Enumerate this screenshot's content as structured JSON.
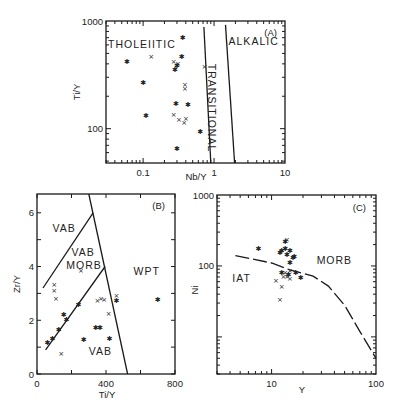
{
  "chart_data": [
    {
      "id": "A",
      "type": "scatter",
      "panel_label": "(A)",
      "xlabel": "Nb/Y",
      "ylabel": "Ti/Y",
      "xscale": "log",
      "yscale": "log",
      "xlim": [
        0.03,
        10
      ],
      "ylim": [
        48,
        1000
      ],
      "xticks": [
        {
          "v": 0.1,
          "label": "0.1"
        },
        {
          "v": 1,
          "label": "1"
        },
        {
          "v": 10,
          "label": "10"
        }
      ],
      "yticks": [
        {
          "v": 100,
          "label": "100"
        },
        {
          "v": 1000,
          "label": "1000"
        }
      ],
      "fields": [
        {
          "name": "THOLEIITIC",
          "x": 0.032,
          "y": 560,
          "rotate": 0
        },
        {
          "name": "TRANSITIONAL",
          "x": 0.83,
          "y": 400,
          "rotate": 90
        },
        {
          "name": "ALKALIC",
          "x": 1.6,
          "y": 600,
          "rotate": 0
        }
      ],
      "boundaries": [
        {
          "points": [
            [
              0.72,
              880
            ],
            [
              0.9,
              48
            ]
          ]
        },
        {
          "points": [
            [
              1.45,
              920
            ],
            [
              1.95,
              48
            ]
          ]
        }
      ],
      "series": [
        {
          "name": "asterisk",
          "marker": "✱",
          "points": [
            [
              0.059,
              417
            ],
            [
              0.28,
              350
            ],
            [
              0.35,
              463
            ],
            [
              0.36,
              700
            ],
            [
              0.1,
              266
            ],
            [
              0.29,
              170
            ],
            [
              0.43,
              165
            ],
            [
              0.11,
              132
            ],
            [
              0.64,
              94
            ],
            [
              0.3,
              65
            ],
            [
              0.3,
              380
            ]
          ]
        },
        {
          "name": "cross",
          "marker": "×",
          "points": [
            [
              0.13,
              463
            ],
            [
              0.27,
              417
            ],
            [
              0.31,
              395
            ],
            [
              0.39,
              255
            ],
            [
              0.39,
              235
            ],
            [
              0.27,
              135
            ],
            [
              0.32,
              120
            ],
            [
              0.4,
              122
            ],
            [
              0.38,
              113
            ],
            [
              0.73,
              375
            ]
          ]
        }
      ]
    },
    {
      "id": "B",
      "type": "scatter",
      "panel_label": "(B)",
      "xlabel": "Ti/Y",
      "ylabel": "Zr/Y",
      "xscale": "linear",
      "yscale": "linear",
      "xlim": [
        0,
        800
      ],
      "ylim": [
        0,
        6.7
      ],
      "xticks": [
        {
          "v": 0,
          "label": "0"
        },
        {
          "v": 400,
          "label": "400"
        },
        {
          "v": 800,
          "label": "800"
        }
      ],
      "yticks": [
        {
          "v": 0,
          "label": "0"
        },
        {
          "v": 2,
          "label": "2"
        },
        {
          "v": 4,
          "label": "4"
        },
        {
          "v": 6,
          "label": "6"
        }
      ],
      "fields": [
        {
          "name": "VAB",
          "x": 90,
          "y": 5.3
        },
        {
          "name": "VAB",
          "x": 200,
          "y": 4.4
        },
        {
          "name": "MORB",
          "x": 170,
          "y": 3.9
        },
        {
          "name": "WPT",
          "x": 560,
          "y": 3.7
        },
        {
          "name": "VAB",
          "x": 300,
          "y": 0.7
        }
      ],
      "boundaries": [
        {
          "points": [
            [
              300,
              6.7
            ],
            [
              525,
              0
            ]
          ]
        },
        {
          "points": [
            [
              35,
              3.2
            ],
            [
              325,
              6.0
            ]
          ]
        },
        {
          "points": [
            [
              50,
              0.9
            ],
            [
              395,
              4.0
            ]
          ]
        }
      ],
      "series": [
        {
          "name": "asterisk",
          "marker": "✱",
          "points": [
            [
              60,
              1.15
            ],
            [
              90,
              1.3
            ],
            [
              125,
              1.65
            ],
            [
              155,
              2.2
            ],
            [
              170,
              2.0
            ],
            [
              240,
              2.55
            ],
            [
              270,
              1.25
            ],
            [
              340,
              1.7
            ],
            [
              365,
              1.7
            ],
            [
              420,
              1.3
            ],
            [
              460,
              2.7
            ],
            [
              700,
              2.75
            ]
          ]
        },
        {
          "name": "cross",
          "marker": "×",
          "points": [
            [
              100,
              3.3
            ],
            [
              100,
              3.1
            ],
            [
              110,
              2.8
            ],
            [
              255,
              3.85
            ],
            [
              140,
              0.75
            ],
            [
              350,
              2.7
            ],
            [
              370,
              2.8
            ],
            [
              390,
              2.75
            ],
            [
              415,
              2.25
            ],
            [
              460,
              2.9
            ]
          ]
        }
      ]
    },
    {
      "id": "C",
      "type": "scatter",
      "panel_label": "(C)",
      "xlabel": "Y",
      "ylabel": "Ni",
      "xscale": "log",
      "yscale": "log",
      "xlim": [
        3,
        100
      ],
      "ylim": [
        3,
        1000
      ],
      "xticks": [
        {
          "v": 10,
          "label": "10"
        },
        {
          "v": 100,
          "label": "100"
        }
      ],
      "yticks": [
        {
          "v": 100,
          "label": "100"
        },
        {
          "v": 1000,
          "label": "1000"
        }
      ],
      "fields": [
        {
          "name": "IAT",
          "x": 4.2,
          "y": 60
        },
        {
          "name": "MORB",
          "x": 27,
          "y": 105
        }
      ],
      "boundaries": [
        {
          "style": "dashed",
          "points": [
            [
              4.5,
              140
            ],
            [
              10,
              110
            ],
            [
              15,
              88
            ],
            [
              25,
              72
            ],
            [
              35,
              52
            ],
            [
              50,
              28
            ],
            [
              70,
              12
            ],
            [
              100,
              5
            ]
          ]
        }
      ],
      "series": [
        {
          "name": "asterisk",
          "marker": "✱",
          "points": [
            [
              7.5,
              175
            ],
            [
              12,
              150
            ],
            [
              12.5,
              160
            ],
            [
              13.5,
              175
            ],
            [
              14,
              145
            ],
            [
              15,
              165
            ],
            [
              15,
              110
            ],
            [
              16,
              130
            ],
            [
              16.5,
              135
            ],
            [
              12.5,
              80
            ],
            [
              14.5,
              75
            ],
            [
              17,
              80
            ],
            [
              19,
              68
            ],
            [
              13.5,
              220
            ]
          ]
        },
        {
          "name": "cross",
          "marker": "×",
          "points": [
            [
              14,
              230
            ],
            [
              11,
              62
            ],
            [
              12.5,
              50
            ],
            [
              12,
              33
            ],
            [
              13,
              70
            ],
            [
              14,
              70
            ],
            [
              15,
              66
            ],
            [
              15,
              85
            ],
            [
              13.5,
              80
            ]
          ]
        }
      ]
    }
  ]
}
